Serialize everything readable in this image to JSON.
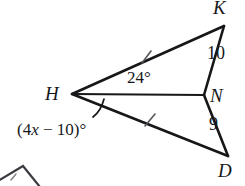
{
  "figure": {
    "background_color": "#ffffff",
    "stroke_color": "#17171a",
    "tick_color": "#5a5a60",
    "vertices": [
      {
        "name": "K",
        "label": "K",
        "x": 224,
        "y": 26
      },
      {
        "name": "H",
        "label": "H",
        "x": 72,
        "y": 94
      },
      {
        "name": "N",
        "label": "N",
        "x": 204,
        "y": 95
      },
      {
        "name": "D",
        "label": "D",
        "x": 228,
        "y": 156
      }
    ],
    "segments": [
      {
        "name": "HK",
        "from": "H",
        "to": "K",
        "tick_marks": 1
      },
      {
        "name": "KN",
        "from": "K",
        "to": "N",
        "tick_marks": 0,
        "measure": "10"
      },
      {
        "name": "HN",
        "from": "H",
        "to": "N",
        "tick_marks": 0
      },
      {
        "name": "ND",
        "from": "N",
        "to": "D",
        "tick_marks": 0,
        "measure": "9"
      },
      {
        "name": "HD",
        "from": "H",
        "to": "D",
        "tick_marks": 1
      }
    ],
    "angles": [
      {
        "name": "KHN",
        "label": "24°",
        "value": "24",
        "unit": "degrees",
        "marked_with_arc": false
      },
      {
        "name": "NHD",
        "label": "(4x − 10)°",
        "expression": "4x − 10",
        "unit": "degrees",
        "marked_with_arc": true
      }
    ],
    "labels": {
      "K": "K",
      "H": "H",
      "N": "N",
      "D": "D",
      "KN_measure": "10",
      "ND_measure": "9",
      "angle_KHN": "24°",
      "angle_NHD_open_paren": "(",
      "angle_NHD_coefficient": "4",
      "angle_NHD_variable": "x",
      "angle_NHD_operator": "−",
      "angle_NHD_constant": "10",
      "angle_NHD_close_paren": ")",
      "angle_NHD_degree": "°"
    },
    "partial_shape": {
      "name": "cropped-adjacent-figure",
      "description": "partially visible quadrilateral at bottom-left edge"
    }
  }
}
